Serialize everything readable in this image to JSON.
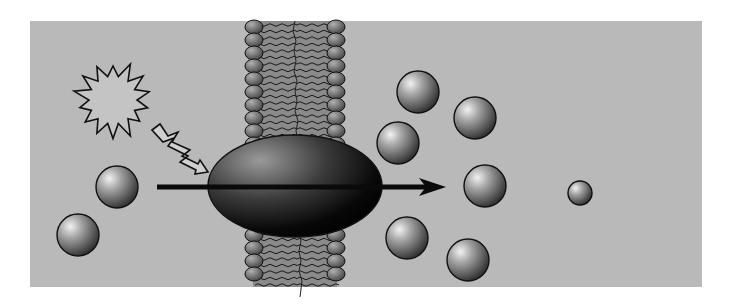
{
  "diagram": {
    "title": "",
    "colors": {
      "background": "#ffffff",
      "panel": "#b9b9b9",
      "outline": "#111111",
      "sphere_light": "#e6e6e6",
      "sphere_dark": "#3a3a3a",
      "lipid_head": "#6e6e6e",
      "channel_dark": "#050505"
    },
    "panel": {
      "x": 30,
      "y": 21,
      "w": 672,
      "h": 266
    },
    "membrane": {
      "x_left": 245,
      "x_right": 345,
      "y_top": 21,
      "y_bottom": 287,
      "head_radius_x": 9,
      "head_radius_y": 7,
      "head_spacing": 13
    },
    "channel_protein": {
      "cx": 295,
      "cy": 186,
      "rx": 87,
      "ry": 51,
      "label": "channel-protein"
    },
    "signal": {
      "starburst": {
        "cx": 113,
        "cy": 100,
        "r_outer": 40,
        "r_inner": 24,
        "points": 14
      }
    },
    "transport_arrow": {
      "x1": 157,
      "y1": 187,
      "x2": 446,
      "y2": 187
    },
    "molecules_outside": [
      {
        "cx": 117,
        "cy": 187,
        "r": 21
      },
      {
        "cx": 78,
        "cy": 235,
        "r": 21
      }
    ],
    "molecules_inside": [
      {
        "cx": 418,
        "cy": 92,
        "r": 21
      },
      {
        "cx": 398,
        "cy": 143,
        "r": 21
      },
      {
        "cx": 475,
        "cy": 118,
        "r": 21
      },
      {
        "cx": 485,
        "cy": 186,
        "r": 21
      },
      {
        "cx": 407,
        "cy": 238,
        "r": 21
      },
      {
        "cx": 468,
        "cy": 260,
        "r": 21
      },
      {
        "cx": 580,
        "cy": 193,
        "r": 12
      }
    ]
  }
}
